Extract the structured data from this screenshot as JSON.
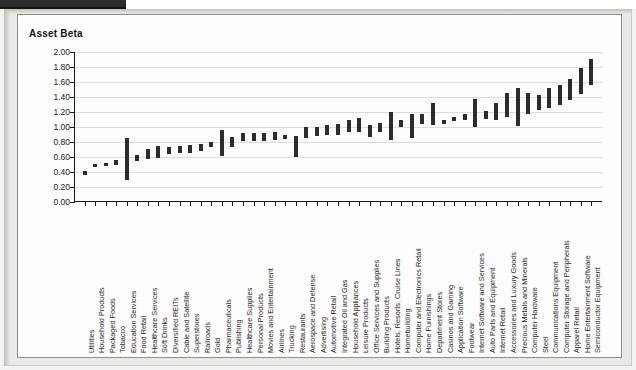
{
  "figure": {
    "title": "Asset Beta"
  },
  "chart_data": {
    "type": "bar",
    "title": "Asset Beta",
    "xlabel": "",
    "ylabel": "Asset Beta",
    "ylim": [
      0.0,
      2.0
    ],
    "ytick_labels": [
      "2.00",
      "1.80",
      "1.60",
      "1.40",
      "1.20",
      "1.00",
      "0.80",
      "0.60",
      "0.40",
      "0.20",
      "0.00"
    ],
    "ytick_values": [
      2.0,
      1.8,
      1.6,
      1.4,
      1.2,
      1.0,
      0.8,
      0.6,
      0.4,
      0.2,
      0.0
    ],
    "grid": true,
    "legend": "none",
    "bar_style": "floating range bars (low to high)",
    "categories": [
      "Utilities",
      "Household Products",
      "Packaged Foods",
      "Tobacco",
      "Education Services",
      "Food Retail",
      "Healthcare Services",
      "Soft Drinks",
      "Diversified REITs",
      "Cable and Satellite",
      "Superstores",
      "Railroads",
      "Gold",
      "Pharmaceuticals",
      "Publishing",
      "Healthcare Supplies",
      "Personal Products",
      "Movies and Entertainment",
      "Airlines",
      "Trucking",
      "Restaurants",
      "Aerospace and Defense",
      "Advertising",
      "Automotive Retail",
      "Integrated Oil and Gas",
      "Household Appliances",
      "Leisure Products",
      "Office Services and Supplies",
      "Building Products",
      "Hotels, Resorts, Cruise Lines",
      "Homebuilding",
      "Computer and Electronics Retail",
      "Home Furnishings",
      "Department Stores",
      "Casinos and Gaming",
      "Application Software",
      "Footwear",
      "Internet Software and Services",
      "Auto Parts and Equipment",
      "Internet Retail",
      "Accessories and Luxury Goods",
      "Precious Metals and Minerals",
      "Computer Hardware",
      "Steel",
      "Communications Equipment",
      "Computer Storage and Peripherals",
      "Apparel Retail",
      "Home Entertainment Software",
      "Semiconductor Equipment"
    ],
    "ranges": [
      {
        "category": "Utilities",
        "low": 0.36,
        "high": 0.41
      },
      {
        "category": "Household Products",
        "low": 0.47,
        "high": 0.51
      },
      {
        "category": "Packaged Foods",
        "low": 0.48,
        "high": 0.52
      },
      {
        "category": "Tobacco",
        "low": 0.5,
        "high": 0.56
      },
      {
        "category": "Education Services",
        "low": 0.29,
        "high": 0.85
      },
      {
        "category": "Food Retail",
        "low": 0.55,
        "high": 0.63
      },
      {
        "category": "Healthcare Services",
        "low": 0.57,
        "high": 0.71
      },
      {
        "category": "Soft Drinks",
        "low": 0.59,
        "high": 0.75
      },
      {
        "category": "Diversified REITs",
        "low": 0.64,
        "high": 0.74
      },
      {
        "category": "Cable and Satellite",
        "low": 0.65,
        "high": 0.75
      },
      {
        "category": "Superstores",
        "low": 0.65,
        "high": 0.76
      },
      {
        "category": "Railroads",
        "low": 0.68,
        "high": 0.77
      },
      {
        "category": "Gold",
        "low": 0.73,
        "high": 0.8
      },
      {
        "category": "Pharmaceuticals",
        "low": 0.61,
        "high": 0.96
      },
      {
        "category": "Publishing",
        "low": 0.74,
        "high": 0.87
      },
      {
        "category": "Healthcare Supplies",
        "low": 0.81,
        "high": 0.92
      },
      {
        "category": "Personal Products",
        "low": 0.82,
        "high": 0.92
      },
      {
        "category": "Movies and Entertainment",
        "low": 0.81,
        "high": 0.92
      },
      {
        "category": "Airlines",
        "low": 0.83,
        "high": 0.93
      },
      {
        "category": "Trucking",
        "low": 0.84,
        "high": 0.89
      },
      {
        "category": "Restaurants",
        "low": 0.6,
        "high": 0.88
      },
      {
        "category": "Aerospace and Defense",
        "low": 0.86,
        "high": 1.0
      },
      {
        "category": "Advertising",
        "low": 0.88,
        "high": 1.0
      },
      {
        "category": "Automotive Retail",
        "low": 0.89,
        "high": 1.03
      },
      {
        "category": "Integrated Oil and Gas",
        "low": 0.9,
        "high": 1.04
      },
      {
        "category": "Household Appliances",
        "low": 0.93,
        "high": 1.09
      },
      {
        "category": "Leisure Products",
        "low": 0.94,
        "high": 1.12
      },
      {
        "category": "Office Services and Supplies",
        "low": 0.87,
        "high": 1.03
      },
      {
        "category": "Building Products",
        "low": 0.94,
        "high": 1.05
      },
      {
        "category": "Hotels, Resorts, Cruise Lines",
        "low": 0.83,
        "high": 1.2
      },
      {
        "category": "Homebuilding",
        "low": 1.0,
        "high": 1.09
      },
      {
        "category": "Computer and Electronics Retail",
        "low": 0.85,
        "high": 1.17
      },
      {
        "category": "Home Furnishings",
        "low": 1.04,
        "high": 1.18
      },
      {
        "category": "Department Stores",
        "low": 1.03,
        "high": 1.32
      },
      {
        "category": "Casinos and Gaming",
        "low": 1.04,
        "high": 1.09
      },
      {
        "category": "Application Software",
        "low": 1.08,
        "high": 1.14
      },
      {
        "category": "Footwear",
        "low": 1.09,
        "high": 1.18
      },
      {
        "category": "Internet Software and Services",
        "low": 1.0,
        "high": 1.38
      },
      {
        "category": "Auto Parts and Equipment",
        "low": 1.11,
        "high": 1.21
      },
      {
        "category": "Internet Retail",
        "low": 1.09,
        "high": 1.32
      },
      {
        "category": "Accessories and Luxury Goods",
        "low": 1.13,
        "high": 1.46
      },
      {
        "category": "Precious Metals and Minerals",
        "low": 1.01,
        "high": 1.52
      },
      {
        "category": "Computer Hardware",
        "low": 1.17,
        "high": 1.45
      },
      {
        "category": "Steel",
        "low": 1.23,
        "high": 1.43
      },
      {
        "category": "Communications Equipment",
        "low": 1.26,
        "high": 1.52
      },
      {
        "category": "Computer Storage and Peripherals",
        "low": 1.3,
        "high": 1.56
      },
      {
        "category": "Apparel Retail",
        "low": 1.36,
        "high": 1.64
      },
      {
        "category": "Home Entertainment Software",
        "low": 1.44,
        "high": 1.79
      },
      {
        "category": "Semiconductor Equipment",
        "low": 1.56,
        "high": 1.91
      }
    ]
  }
}
